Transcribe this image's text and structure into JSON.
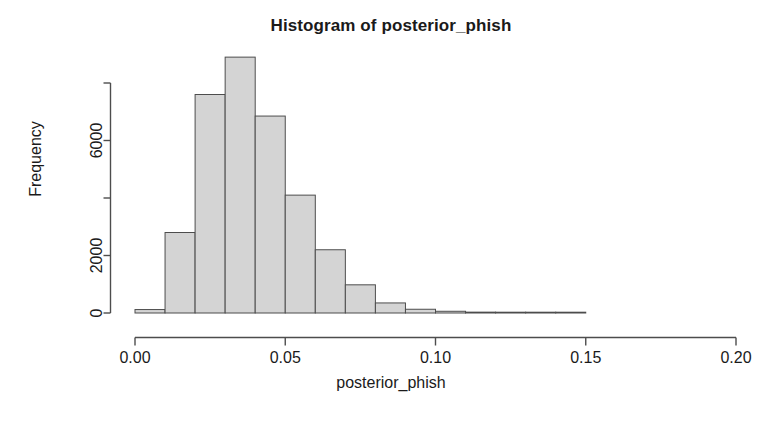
{
  "chart_data": {
    "type": "bar",
    "title": "Histogram of posterior_phish",
    "xlabel": "posterior_phish",
    "ylabel": "Frequency",
    "grid": false,
    "legend": "none",
    "xlim": [
      0.0,
      0.2
    ],
    "ylim": [
      0,
      8900
    ],
    "xticks": [
      0.0,
      0.05,
      0.1,
      0.15,
      0.2
    ],
    "xticklabels": [
      "0.00",
      "0.05",
      "0.10",
      "0.15",
      "0.20"
    ],
    "yticks": [
      0,
      2000,
      4000,
      6000,
      8000
    ],
    "yticklabels": [
      "0",
      "2000",
      "",
      "6000",
      ""
    ],
    "bin_width": 0.01,
    "bin_edges": [
      0.0,
      0.01,
      0.02,
      0.03,
      0.04,
      0.05,
      0.06,
      0.07,
      0.08,
      0.09,
      0.1,
      0.11,
      0.12,
      0.13,
      0.14,
      0.15
    ],
    "categories": [
      "0.00-0.01",
      "0.01-0.02",
      "0.02-0.03",
      "0.03-0.04",
      "0.04-0.05",
      "0.05-0.06",
      "0.06-0.07",
      "0.07-0.08",
      "0.08-0.09",
      "0.09-0.10",
      "0.10-0.11",
      "0.11-0.12",
      "0.12-0.13",
      "0.13-0.14",
      "0.14-0.15"
    ],
    "values": [
      120,
      2800,
      7600,
      8900,
      6850,
      4100,
      2200,
      980,
      350,
      130,
      60,
      30,
      15,
      10,
      5
    ],
    "bar_fill": "#d4d4d4",
    "bar_stroke": "#4d4d4d",
    "axis_color": "#4d4d4d"
  }
}
